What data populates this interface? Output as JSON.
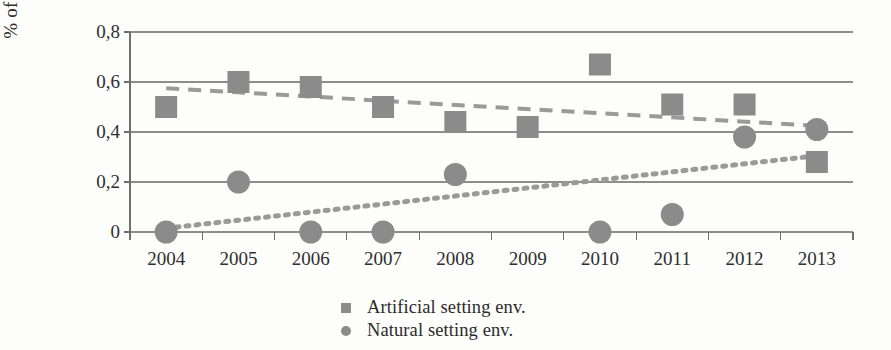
{
  "chart_data": {
    "type": "scatter",
    "title": "",
    "xlabel": "",
    "ylabel": "% of publications",
    "categories": [
      "2004",
      "2005",
      "2006",
      "2007",
      "2008",
      "2009",
      "2010",
      "2011",
      "2012",
      "2013"
    ],
    "x": [
      2004,
      2005,
      2006,
      2007,
      2008,
      2009,
      2010,
      2011,
      2012,
      2013
    ],
    "ylim": [
      0,
      0.8
    ],
    "xlim": [
      2003.5,
      2013.5
    ],
    "y_ticks": [
      0,
      0.2,
      0.4,
      0.6,
      0.8
    ],
    "y_tick_labels": [
      "0",
      "0,2",
      "0,4",
      "0,6",
      "0,8"
    ],
    "grid": "horizontal",
    "legend_position": "bottom-center",
    "decimal_separator": ",",
    "series": [
      {
        "name": "Artificial setting env.",
        "marker": "square",
        "color": "#8b8b8b",
        "values": [
          0.5,
          0.6,
          0.58,
          0.5,
          0.44,
          0.42,
          0.67,
          0.51,
          0.51,
          0.28
        ],
        "trendline": {
          "style": "dashed",
          "color": "#9a9a9a",
          "start": 0.575,
          "end": 0.425
        }
      },
      {
        "name": "Natural setting env.",
        "marker": "circle",
        "color": "#8b8b8b",
        "values": [
          0.0,
          0.2,
          0.0,
          0.0,
          0.23,
          null,
          0.0,
          0.07,
          0.38,
          0.41
        ],
        "trendline": {
          "style": "dotted",
          "color": "#9a9a9a",
          "start": 0.015,
          "end": 0.305
        }
      }
    ]
  },
  "legend": {
    "items": [
      {
        "label": "Artificial setting env.",
        "marker": "square-marker-icon"
      },
      {
        "label": "Natural setting env.",
        "marker": "circle-marker-icon"
      }
    ]
  },
  "axes": {
    "y_title": "% of publications"
  }
}
